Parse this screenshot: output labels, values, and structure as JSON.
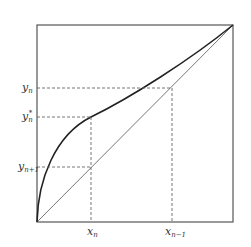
{
  "diagram": {
    "type": "fixed-point iteration plot",
    "colors": {
      "frame": "#555555",
      "curve": "#222222",
      "diagonal": "#777777",
      "dashed": "#666666",
      "text": "#333333"
    },
    "labels": {
      "y_n": {
        "base": "y",
        "sub": "n"
      },
      "y_n_star": {
        "base": "y",
        "sub": "n",
        "sup": "*"
      },
      "y_n_plus_1": {
        "base": "y",
        "sub": "n+1"
      },
      "x_n": {
        "base": "x",
        "sub": "n"
      },
      "x_n_minus_1": {
        "base": "x",
        "sub": "n−1"
      }
    }
  }
}
